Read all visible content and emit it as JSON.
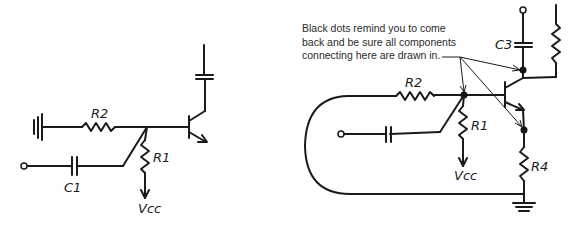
{
  "left_circuit": {
    "labels": {
      "r2": "R2",
      "r1": "R1",
      "c1": "C1",
      "vcc": "Vcc"
    }
  },
  "right_circuit": {
    "labels": {
      "r2": "R2",
      "r1": "R1",
      "c3": "C3",
      "r4": "R4",
      "vcc": "Vcc"
    },
    "annotation": {
      "lines": [
        "Black dots remind you to come",
        "back and be sure all components",
        "connecting here are drawn in."
      ]
    }
  }
}
